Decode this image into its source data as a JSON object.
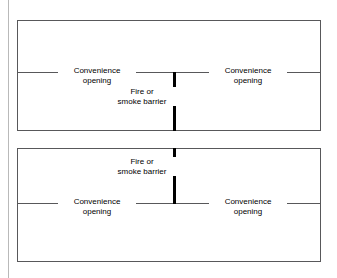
{
  "figure": {
    "caption_visible": false,
    "colors": {
      "background": "#ffffff",
      "outline": "#58585a",
      "barrier": "#000000",
      "page_rule": "#b9b9b9",
      "text": "#000000"
    },
    "diagrams": [
      {
        "id": "top-diagram",
        "name": "barrier-extends-below-opening-line",
        "barrier": {
          "label_line_1": "Fire or",
          "label_line_2": "smoke barrier",
          "position": "center",
          "extends": "from opening line down to bottom of room"
        },
        "opening_line": {
          "present": true,
          "position": "upper-middle"
        },
        "openings": [
          {
            "side": "left",
            "label_line_1": "Convenience",
            "label_line_2": "opening"
          },
          {
            "side": "right",
            "label_line_1": "Convenience",
            "label_line_2": "opening"
          }
        ]
      },
      {
        "id": "bottom-diagram",
        "name": "barrier-extends-above-opening-line",
        "barrier": {
          "label_line_1": "Fire or",
          "label_line_2": "smoke barrier",
          "position": "center",
          "extends": "from top of room down to opening line"
        },
        "opening_line": {
          "present": true,
          "position": "lower-middle"
        },
        "openings": [
          {
            "side": "left",
            "label_line_1": "Convenience",
            "label_line_2": "opening"
          },
          {
            "side": "right",
            "label_line_1": "Convenience",
            "label_line_2": "opening"
          }
        ]
      }
    ]
  }
}
